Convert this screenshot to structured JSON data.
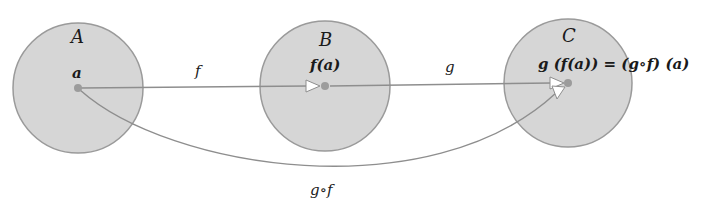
{
  "diagram": {
    "type": "function-composition",
    "colors": {
      "set_fill": "#d6d6d6",
      "set_stroke": "#9a9a9a",
      "arrow": "#8e8e8e",
      "dot": "#9c9c9c",
      "text": "#1a1a1a"
    },
    "sets": [
      {
        "name": "A",
        "element": "a"
      },
      {
        "name": "B",
        "element": "f(a)"
      },
      {
        "name": "C",
        "element": "g (f(a)) = (g∘f) (a)"
      }
    ],
    "mappings": [
      {
        "label": "f",
        "from": "A",
        "to": "B"
      },
      {
        "label": "g",
        "from": "B",
        "to": "C"
      },
      {
        "label": "g∘f",
        "from": "A",
        "to": "C"
      }
    ]
  }
}
